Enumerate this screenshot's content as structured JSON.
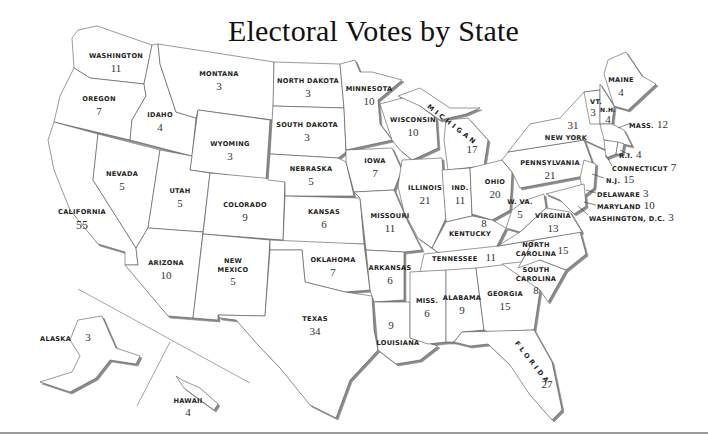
{
  "title": "Electoral Votes by State",
  "colors": {
    "border": "#555555",
    "fill": "#ffffff",
    "shadow": "#9a9a9a",
    "text": "#222222"
  },
  "states": {
    "washington": {
      "name": "WASHINGTON",
      "votes": "11"
    },
    "oregon": {
      "name": "OREGON",
      "votes": "7"
    },
    "california": {
      "name": "CALIFORNIA",
      "votes": "55"
    },
    "idaho": {
      "name": "IDAHO",
      "votes": "4"
    },
    "nevada": {
      "name": "NEVADA",
      "votes": "5"
    },
    "montana": {
      "name": "MONTANA",
      "votes": "3"
    },
    "wyoming": {
      "name": "WYOMING",
      "votes": "3"
    },
    "utah": {
      "name": "UTAH",
      "votes": "5"
    },
    "arizona": {
      "name": "ARIZONA",
      "votes": "10"
    },
    "colorado": {
      "name": "COLORADO",
      "votes": "9"
    },
    "new_mexico": {
      "name_line1": "NEW",
      "name_line2": "MEXICO",
      "votes": "5"
    },
    "north_dakota": {
      "name": "NORTH DAKOTA",
      "votes": "3"
    },
    "south_dakota": {
      "name": "SOUTH DAKOTA",
      "votes": "3"
    },
    "nebraska": {
      "name": "NEBRASKA",
      "votes": "5"
    },
    "kansas": {
      "name": "KANSAS",
      "votes": "6"
    },
    "oklahoma": {
      "name": "OKLAHOMA",
      "votes": "7"
    },
    "texas": {
      "name": "TEXAS",
      "votes": "34"
    },
    "minnesota": {
      "name": "MINNESOTA",
      "votes": "10"
    },
    "iowa": {
      "name": "IOWA",
      "votes": "7"
    },
    "missouri": {
      "name": "MISSOURI",
      "votes": "11"
    },
    "arkansas": {
      "name": "ARKANSAS",
      "votes": "6"
    },
    "louisiana": {
      "name": "LOUISIANA",
      "votes": "9"
    },
    "wisconsin": {
      "name": "WISCONSIN",
      "votes": "10"
    },
    "illinois": {
      "name": "ILLINOIS",
      "votes": "21"
    },
    "michigan": {
      "name": "MICHIGAN",
      "votes": "17"
    },
    "indiana": {
      "name": "IND.",
      "votes": "11"
    },
    "ohio": {
      "name": "OHIO",
      "votes": "20"
    },
    "kentucky": {
      "name": "KENTUCKY",
      "votes": "8"
    },
    "tennessee": {
      "name": "TENNESSEE",
      "votes": "11"
    },
    "mississippi": {
      "name": "MISS.",
      "votes": "6"
    },
    "alabama": {
      "name": "ALABAMA",
      "votes": "9"
    },
    "georgia": {
      "name": "GEORGIA",
      "votes": "15"
    },
    "florida": {
      "name": "FLORIDA",
      "votes": "27"
    },
    "south_carolina": {
      "name_line1": "SOUTH",
      "name_line2": "CAROLINA",
      "votes": "8"
    },
    "north_carolina": {
      "name_line1": "NORTH",
      "name_line2": "CAROLINA",
      "votes": "15"
    },
    "virginia": {
      "name": "VIRGINIA",
      "votes": "13"
    },
    "west_virginia": {
      "name": "W. VA.",
      "votes": "5"
    },
    "pennsylvania": {
      "name": "PENNSYLVANIA",
      "votes": "21"
    },
    "new_york": {
      "name": "NEW YORK",
      "votes": "31"
    },
    "vermont": {
      "name": "VT.",
      "votes": "3"
    },
    "new_hampshire": {
      "name": "N.H.",
      "votes": "4"
    },
    "maine": {
      "name": "MAINE",
      "votes": "4"
    },
    "massachusetts": {
      "name": "MASS.",
      "votes": "12"
    },
    "rhode_island": {
      "name": "R.I.",
      "votes": "4"
    },
    "connecticut": {
      "name": "CONNECTICUT",
      "votes": "7"
    },
    "new_jersey": {
      "name": "N.J.",
      "votes": "15"
    },
    "delaware": {
      "name": "DELAWARE",
      "votes": "3"
    },
    "maryland": {
      "name": "MARYLAND",
      "votes": "10"
    },
    "washington_dc": {
      "name": "WASHINGTON, D.C.",
      "votes": "3"
    },
    "alaska": {
      "name": "ALASKA",
      "votes": "3"
    },
    "hawaii": {
      "name": "HAWAII",
      "votes": "4"
    }
  }
}
